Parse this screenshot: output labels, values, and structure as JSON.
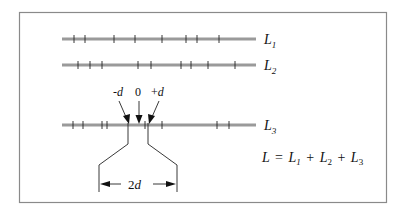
{
  "lines": [
    {
      "id": "L1",
      "label": "L",
      "sub": "1",
      "y": 39,
      "x1": 62,
      "x2": 256,
      "ticks": [
        74,
        85,
        114,
        135,
        162,
        186,
        197,
        219
      ]
    },
    {
      "id": "L2",
      "label": "L",
      "sub": "2",
      "y": 65,
      "x1": 62,
      "x2": 256,
      "ticks": [
        78,
        90,
        102,
        138,
        151,
        181,
        191,
        208,
        235
      ]
    },
    {
      "id": "L3",
      "label": "L",
      "sub": "3",
      "y": 125,
      "x1": 62,
      "x2": 256,
      "ticks": [
        73,
        83,
        102,
        107,
        145,
        162,
        217,
        229
      ]
    }
  ],
  "markers": {
    "minus_d": "-d",
    "zero": "0",
    "plus_d": "+d"
  },
  "dimension": {
    "label": "2d"
  },
  "equation": {
    "lhs": "L",
    "equals": "=",
    "terms": [
      {
        "label": "L",
        "sub": "1"
      },
      {
        "label": "L",
        "sub": "2"
      },
      {
        "label": "L",
        "sub": "3"
      }
    ],
    "plus": "+"
  },
  "colors": {
    "line": "#9a9a9a",
    "ink": "#222222",
    "frame": "#8a8a8a"
  }
}
